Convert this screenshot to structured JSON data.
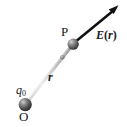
{
  "figure": {
    "background_color": "#ffffff",
    "labels": {
      "source_charge": "q",
      "source_charge_subscript": "0",
      "origin": "O",
      "field_point": "P",
      "position_vector": "r",
      "field_vector_symbol": "E",
      "field_vector_open_paren": "(",
      "field_vector_argument": "r",
      "field_vector_close_paren": ")"
    },
    "colors": {
      "arrow": "#111111",
      "rod_light": "#e8e8e8",
      "rod_mid": "#b8b8b8",
      "rod_dark": "#8a8a8a",
      "sphere_dark": "#3a3a3a",
      "sphere_mid": "#6e6e6e",
      "sphere_highlight": "#d8d8d8",
      "text": "#1a1a1a"
    },
    "geometry": {
      "origin_point": [
        25,
        105
      ],
      "field_point": [
        73,
        44
      ],
      "arrow_tip": [
        118,
        6
      ],
      "marker_point": [
        62,
        57
      ],
      "origin_sphere_radius": 6.5,
      "field_sphere_radius": 5.5,
      "marker_radius": 2.2
    }
  }
}
